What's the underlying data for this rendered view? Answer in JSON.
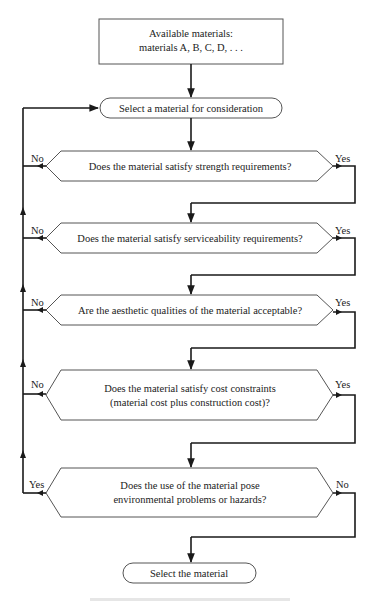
{
  "flowchart": {
    "start_box": {
      "line1": "Available materials:",
      "line2": "materials A, B, C, D, . . ."
    },
    "select_consider": "Select a material for consideration",
    "decisions": [
      {
        "line1": "Does the material satisfy strength requirements?",
        "line2": "",
        "left_label": "No",
        "right_label": "Yes"
      },
      {
        "line1": "Does the material satisfy serviceability requirements?",
        "line2": "",
        "left_label": "No",
        "right_label": "Yes"
      },
      {
        "line1": "Are the aesthetic qualities of the material acceptable?",
        "line2": "",
        "left_label": "No",
        "right_label": "Yes"
      },
      {
        "line1": "Does the material satisfy cost constraints",
        "line2": "(material cost plus construction cost)?",
        "left_label": "No",
        "right_label": "Yes"
      },
      {
        "line1": "Does the use of the material pose",
        "line2": "environmental problems or hazards?",
        "left_label": "Yes",
        "right_label": "No"
      }
    ],
    "end_terminal": "Select the material"
  },
  "colors": {
    "line": "#1a1a1a",
    "shape_border": "#555555",
    "text": "#222222"
  }
}
